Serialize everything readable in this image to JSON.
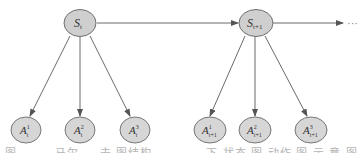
{
  "diagram": {
    "type": "state-action tree",
    "colors": {
      "node_fill": "#cfcfcf",
      "node_stroke": "#6e6e6e",
      "edge": "#6a6a6a",
      "background": "#ffffff"
    },
    "states": [
      {
        "id": "s_t",
        "base": "S",
        "sub": "t",
        "sup": ""
      },
      {
        "id": "s_t1",
        "base": "S",
        "sub": "t+1",
        "sup": ""
      }
    ],
    "actions": [
      {
        "id": "a_t_1",
        "parent": "s_t",
        "base": "A",
        "sub": "t",
        "sup": "1"
      },
      {
        "id": "a_t_2",
        "parent": "s_t",
        "base": "A",
        "sub": "t",
        "sup": "2"
      },
      {
        "id": "a_t_3",
        "parent": "s_t",
        "base": "A",
        "sub": "t",
        "sup": "3"
      },
      {
        "id": "a_t1_1",
        "parent": "s_t1",
        "base": "A",
        "sub": "t+1",
        "sup": "1"
      },
      {
        "id": "a_t1_2",
        "parent": "s_t1",
        "base": "A",
        "sub": "t+1",
        "sup": "2"
      },
      {
        "id": "a_t1_3",
        "parent": "s_t1",
        "base": "A",
        "sub": "t+1",
        "sup": "3"
      }
    ],
    "continuation": "···"
  },
  "caption": "图 — — 马尔 — 夫 图结构 — — — 下 状态 图 动作 图 示 意 图"
}
